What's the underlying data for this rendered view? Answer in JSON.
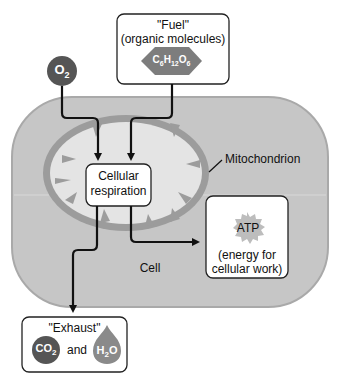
{
  "fuel": {
    "title": "\"Fuel\"",
    "subtitle": "(organic molecules)",
    "molecule": {
      "C": "C",
      "c_sub": "6",
      "H": "H",
      "h_sub": "12",
      "O": "O",
      "o_sub": "6"
    }
  },
  "oxygen": {
    "symbol": "O",
    "subscript": "2"
  },
  "process": {
    "line1": "Cellular",
    "line2": "respiration"
  },
  "organelle": {
    "label": "Mitochondrion"
  },
  "cell": {
    "label": "Cell"
  },
  "atp": {
    "label": "ATP",
    "line1": "(energy for",
    "line2": "cellular work)"
  },
  "exhaust": {
    "title": "\"Exhaust\"",
    "co2": {
      "symbol": "CO",
      "subscript": "2"
    },
    "connector": "and",
    "h2o": {
      "h": "H",
      "subscript": "2",
      "o": "O"
    }
  },
  "colors": {
    "cell_fill": "#c6c6c6",
    "cell_stroke": "#a8a8a8",
    "mito_fill": "#e4e4e4",
    "mito_membrane": "#9a9a9a",
    "molecule_dark": "#555555",
    "water": "#8a8a8a",
    "arrow": "#111111"
  }
}
